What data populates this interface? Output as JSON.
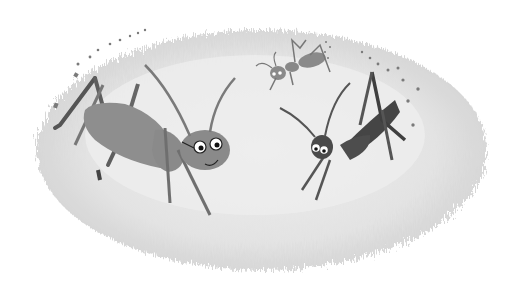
{
  "illustration": {
    "description": "Grayscale painted illustration of three insects on a textured oval ground",
    "colors": {
      "background": "#ffffff",
      "ground_light": "#ececec",
      "ground_mid": "#dcdcdc",
      "ground_edge": "#c9c9c9",
      "big_insect_body": "#8e8e8e",
      "big_insect_legs": "#5a5a5a",
      "dark_insect_body": "#4a4a4a",
      "small_insect_body": "#8a8a8a",
      "footprints": "#7a7a7a"
    },
    "characters": [
      {
        "name": "big-cricket-with-glasses",
        "position": "left",
        "features": [
          "glasses",
          "smile",
          "long antennae"
        ]
      },
      {
        "name": "dark-cricket",
        "position": "right",
        "features": [
          "big eyes",
          "long antennae"
        ]
      },
      {
        "name": "small-ant",
        "position": "top-center",
        "features": [
          "curly antennae"
        ]
      }
    ]
  }
}
